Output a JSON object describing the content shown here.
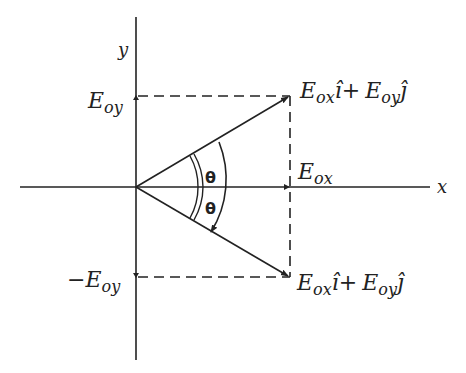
{
  "diagram": {
    "axes": {
      "x_label": "x",
      "y_label": "y"
    },
    "labels": {
      "eoy_main": "E",
      "eoy_sub": "oy",
      "neg_eoy_prefix": "−E",
      "neg_eoy_sub": "oy",
      "eox_main": "E",
      "eox_sub": "ox",
      "vec_top": {
        "e1": "E",
        "s1": "ox",
        "i_hat": "î",
        "plus": "+",
        "e2": "E",
        "s2": "oy",
        "j_hat": "ĵ"
      },
      "vec_bottom": {
        "e1": "E",
        "s1": "ox",
        "i_hat": "î",
        "plus": "+",
        "e2": "E",
        "s2": "oy",
        "j_hat": "ĵ"
      },
      "theta_top": "θ",
      "theta_bottom": "θ"
    },
    "colors": {
      "stroke": "#222222",
      "background": "#ffffff"
    }
  }
}
